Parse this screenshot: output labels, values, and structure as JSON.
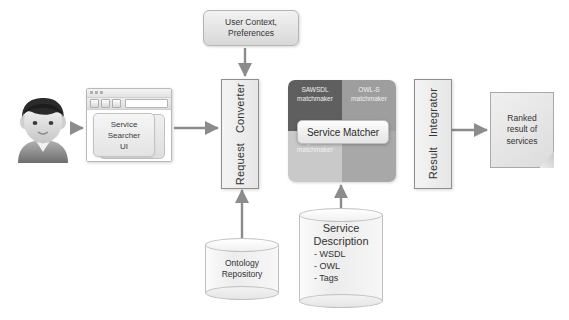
{
  "diagram": {
    "actor": {
      "name": "user-actor",
      "label": ""
    },
    "browser": {
      "window_label": "browser-window",
      "ui_label": "Service\nSearcher\nUI",
      "ui_line1": "Service",
      "ui_line2": "Searcher",
      "ui_line3": "UI"
    },
    "user_context": {
      "line1": "User Context,",
      "line2": "Preferences"
    },
    "request_converter": {
      "line1": "Request",
      "line2": "Converter"
    },
    "service_matcher": {
      "label": "Service Matcher",
      "quadrants": [
        {
          "id": "sawsdl",
          "line1": "SAWSDL",
          "line2": "matchmaker",
          "color": "#5f5f5f"
        },
        {
          "id": "owls",
          "line1": "OWL-S",
          "line2": "matchmaker",
          "color": "#9e9e9e"
        },
        {
          "id": "tag",
          "line1": "Tag-based",
          "line2": "matchmaker",
          "color": "#c9c9c9"
        },
        {
          "id": "etc",
          "line1": "Etc.",
          "line2": "",
          "color": "#a8a8a8"
        }
      ]
    },
    "result_integrator": {
      "line1": "Result",
      "line2": "Integrator"
    },
    "ranked_result": {
      "line1": "Ranked",
      "line2": "result of",
      "line3": "services"
    },
    "ontology_repository": {
      "line1": "Ontology",
      "line2": "Repository"
    },
    "service_description": {
      "line1": "Service",
      "line2": "Description",
      "items": [
        "- WSDL",
        "- OWL",
        "- Tags"
      ]
    },
    "colors": {
      "background": "#ffffff",
      "box_border": "#8e8e8e",
      "box_fill_light": "#f4f4f4",
      "box_fill_dark": "#e6e6e6",
      "arrow": "#8c8c8c",
      "text": "#333333"
    }
  }
}
